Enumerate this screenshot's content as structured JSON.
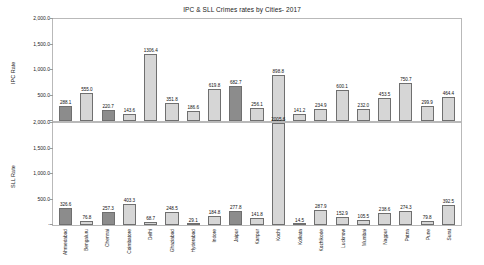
{
  "chart_data": {
    "type": "bar",
    "title": "IPC & SLL Crimes rates by Cities- 2017",
    "xlabel": "",
    "grid": false,
    "legend": "none",
    "categories": [
      "Ahmedabad",
      "Bengaluru",
      "Chennai",
      "Coimbatore",
      "Delhi",
      "Ghaziabad",
      "Hyderabad",
      "Indore",
      "Jaipur",
      "Kanpur",
      "Kochi",
      "Kolkata",
      "Kozhikode",
      "Lucknow",
      "Mumbai",
      "Nagpur",
      "Patna",
      "Pune",
      "Surat"
    ],
    "panels": [
      {
        "name": "ipc",
        "ylabel": "IPC Rate",
        "ylim": [
          0,
          2000
        ],
        "yticks": [
          0,
          500,
          1000,
          1500,
          2000
        ],
        "ytick_labels": [
          "-",
          "500.0",
          "1,000.0",
          "1,500.0",
          "2,000.0"
        ],
        "values": [
          288.1,
          555.0,
          220.7,
          143.6,
          1306.4,
          351.8,
          186.6,
          619.8,
          682.7,
          256.1,
          898.8,
          141.2,
          234.9,
          600.1,
          232.0,
          453.5,
          750.7,
          299.9,
          464.4
        ],
        "shades": [
          "dark",
          "light",
          "dark",
          "light",
          "light",
          "light",
          "light",
          "light",
          "dark",
          "light",
          "light",
          "light",
          "light",
          "light",
          "light",
          "light",
          "light",
          "light",
          "light"
        ]
      },
      {
        "name": "sll",
        "ylabel": "SLL Rate",
        "ylim": [
          0,
          2000
        ],
        "yticks": [
          0,
          500,
          1000,
          1500,
          2000
        ],
        "ytick_labels": [
          "-",
          "500.0",
          "1,000.0",
          "1,500.0",
          "2,000.0"
        ],
        "values": [
          326.6,
          76.8,
          257.3,
          403.3,
          68.7,
          248.5,
          29.1,
          184.8,
          277.8,
          141.8,
          2005.6,
          14.5,
          287.9,
          152.9,
          105.5,
          238.6,
          274.3,
          79.8,
          392.5
        ],
        "shades": [
          "dark",
          "light",
          "dark",
          "light",
          "light",
          "light",
          "light",
          "light",
          "dark",
          "light",
          "light",
          "light",
          "light",
          "light",
          "light",
          "light",
          "light",
          "light",
          "light"
        ]
      }
    ]
  }
}
